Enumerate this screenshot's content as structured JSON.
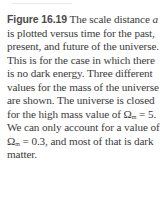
{
  "figure": {
    "label": "Figure 16.19",
    "caption_parts": {
      "p1": " The scale dis­tance ",
      "var_a": "a",
      "p2": " is plotted versus time for the past, present, and future of the universe. This is for the case in which there is no dark energy. Three different values for the mass of the universe are shown. The universe is closed for the high mass value of ",
      "omega1": "Ω",
      "sub1": "m",
      "p3": " = 5. We can only account for a value of ",
      "omega2": "Ω",
      "sub2": "m",
      "p4": " = 0.3, and most of that is dark matter."
    }
  }
}
